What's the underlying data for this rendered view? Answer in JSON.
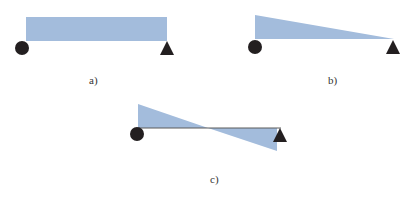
{
  "colors": {
    "load_fill": "#a3bcdc",
    "support": "#231f20",
    "beam_line": "#5a5a5a",
    "label_text": "#333333"
  },
  "panels": [
    {
      "id": "a",
      "label": "a)",
      "load_shape": "uniform-rectangle",
      "description": "Uniform distributed load over simply supported beam"
    },
    {
      "id": "b",
      "label": "b)",
      "load_shape": "triangular-decreasing",
      "description": "Linearly decreasing distributed load from left support to right support"
    },
    {
      "id": "c",
      "label": "c)",
      "load_shape": "antisymmetric-triangular",
      "description": "Antisymmetric linear load: positive on left half, negative on right half"
    }
  ]
}
